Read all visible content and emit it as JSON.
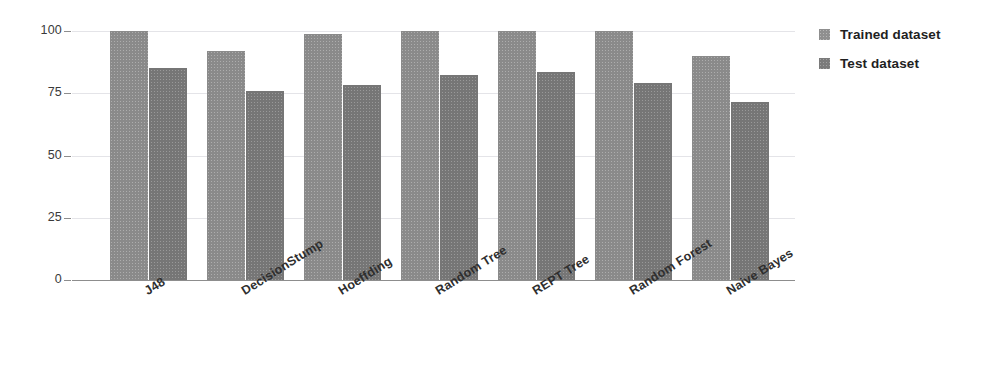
{
  "chart_data": {
    "type": "bar",
    "title": "",
    "subtitle": "",
    "xlabel": "",
    "ylabel": "",
    "ylim": [
      0,
      100
    ],
    "yticks": [
      0,
      25,
      50,
      75,
      100
    ],
    "ytick_labels": [
      "0",
      "25",
      "50",
      "75",
      "100"
    ],
    "grid": true,
    "grid_axis": "y",
    "legend_position": "right",
    "categories": [
      "J48",
      "DecisionStump",
      "Hoeffding",
      "Random Tree",
      "REPT Tree",
      "Random Forest",
      "Naive Bayes"
    ],
    "series": [
      {
        "name": "Trained dataset",
        "color": "#8a8a8a",
        "values": [
          100,
          92,
          99,
          100,
          100,
          100,
          90
        ]
      },
      {
        "name": "Test dataset",
        "color": "#767676",
        "values": [
          85,
          76,
          78.5,
          82.5,
          83.5,
          79,
          71.5
        ]
      }
    ]
  },
  "legend": {
    "items": [
      {
        "label": "Trained dataset",
        "swatch": "trained-swatch"
      },
      {
        "label": "Test dataset",
        "swatch": "test-swatch"
      }
    ]
  }
}
